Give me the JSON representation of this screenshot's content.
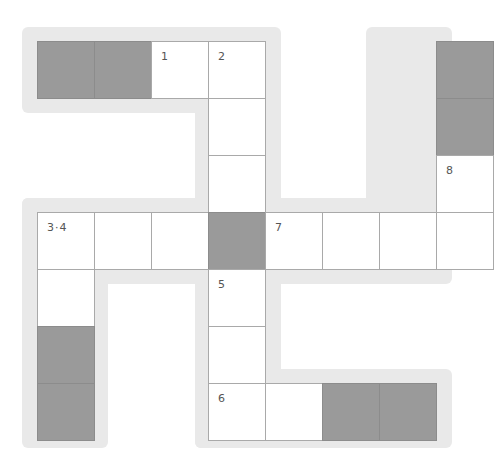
{
  "puzzle": {
    "type": "crossword-grid",
    "cell_size": 57,
    "origin": {
      "x": 37,
      "y": 41
    },
    "colors": {
      "halo": "#e9e9e9",
      "block": "#9a9a9a",
      "cell": "#ffffff",
      "border": "#a9a9a9",
      "number": "#555555"
    },
    "cells": [
      {
        "col": 0,
        "row": 0,
        "type": "block"
      },
      {
        "col": 1,
        "row": 0,
        "type": "block"
      },
      {
        "col": 2,
        "row": 0,
        "type": "open",
        "number": "1"
      },
      {
        "col": 3,
        "row": 0,
        "type": "open",
        "number": "2"
      },
      {
        "col": 7,
        "row": 0,
        "type": "block"
      },
      {
        "col": 3,
        "row": 1,
        "type": "open"
      },
      {
        "col": 7,
        "row": 1,
        "type": "block"
      },
      {
        "col": 3,
        "row": 2,
        "type": "open"
      },
      {
        "col": 7,
        "row": 2,
        "type": "open",
        "number": "8"
      },
      {
        "col": 0,
        "row": 3,
        "type": "open",
        "number": "3·4"
      },
      {
        "col": 1,
        "row": 3,
        "type": "open"
      },
      {
        "col": 2,
        "row": 3,
        "type": "open"
      },
      {
        "col": 3,
        "row": 3,
        "type": "block"
      },
      {
        "col": 4,
        "row": 3,
        "type": "open",
        "number": "7"
      },
      {
        "col": 5,
        "row": 3,
        "type": "open"
      },
      {
        "col": 6,
        "row": 3,
        "type": "open"
      },
      {
        "col": 7,
        "row": 3,
        "type": "open"
      },
      {
        "col": 0,
        "row": 4,
        "type": "open"
      },
      {
        "col": 3,
        "row": 4,
        "type": "open",
        "number": "5"
      },
      {
        "col": 0,
        "row": 5,
        "type": "block"
      },
      {
        "col": 3,
        "row": 5,
        "type": "open"
      },
      {
        "col": 0,
        "row": 6,
        "type": "block"
      },
      {
        "col": 3,
        "row": 6,
        "type": "open",
        "number": "6"
      },
      {
        "col": 4,
        "row": 6,
        "type": "open"
      },
      {
        "col": 5,
        "row": 6,
        "type": "block"
      },
      {
        "col": 6,
        "row": 6,
        "type": "block"
      }
    ],
    "halos": [
      {
        "x": 22,
        "y": 27,
        "w": 254,
        "h": 86
      },
      {
        "x": 195,
        "y": 27,
        "w": 86,
        "h": 200
      },
      {
        "x": 366,
        "y": 27,
        "w": 86,
        "h": 200
      },
      {
        "x": 22,
        "y": 198,
        "w": 430,
        "h": 86
      },
      {
        "x": 22,
        "y": 198,
        "w": 86,
        "h": 250
      },
      {
        "x": 195,
        "y": 198,
        "w": 86,
        "h": 250
      },
      {
        "x": 195,
        "y": 369,
        "w": 257,
        "h": 79
      }
    ]
  }
}
